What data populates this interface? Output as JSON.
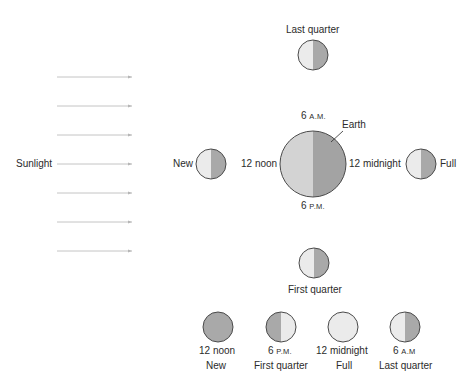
{
  "colors": {
    "lit": "#ebebeb",
    "shadow": "#a9a9a9",
    "earth_lit": "#d3d3d3",
    "earth_shadow": "#a3a3a3",
    "outline": "#4a4a4a",
    "arrow": "#b5b5b5",
    "text": "#2b2b2b"
  },
  "sunlight": {
    "label": "Sunlight",
    "arrow_count": 7
  },
  "earth": {
    "label": "Earth",
    "times": {
      "top_num": "6",
      "top_suffix": "A.M.",
      "bottom_num": "6",
      "bottom_suffix": "P.M.",
      "left": "12 noon",
      "right": "12 midnight"
    }
  },
  "orbit_moons": {
    "top": "Last quarter",
    "left": "New",
    "right": "Full",
    "bottom": "First quarter"
  },
  "phase_row": [
    {
      "time_num": "12 noon",
      "time_suffix": "",
      "phase": "New",
      "appearance": "dark"
    },
    {
      "time_num": "6",
      "time_suffix": "P.M.",
      "phase": "First quarter",
      "appearance": "left-dark"
    },
    {
      "time_num": "12 midnight",
      "time_suffix": "",
      "phase": "Full",
      "appearance": "light"
    },
    {
      "time_num": "6",
      "time_suffix": "A.M",
      "phase": "Last quarter",
      "appearance": "right-dark"
    }
  ]
}
